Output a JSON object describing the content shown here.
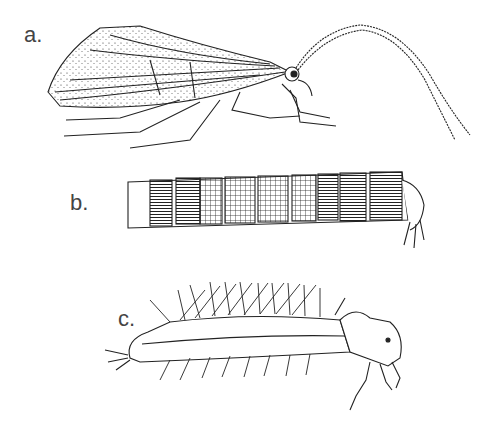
{
  "figure": {
    "panels": [
      {
        "label": "a.",
        "subject": "adult caddisfly (side view)"
      },
      {
        "label": "b.",
        "subject": "larva in case"
      },
      {
        "label": "c.",
        "subject": "larva"
      }
    ],
    "colors": {
      "ink": "#222222",
      "background": "#ffffff",
      "label": "#444444"
    }
  }
}
